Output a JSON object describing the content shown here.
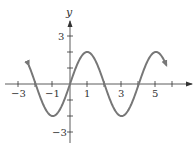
{
  "chart_data": {
    "type": "line",
    "title": "",
    "xlabel": "x",
    "ylabel": "y",
    "function": "y = 2 sin(πx/2)",
    "xlim": [
      -3.5,
      7.2
    ],
    "ylim": [
      -3.7,
      3.8
    ],
    "x_ticks": [
      -3,
      -2,
      -1,
      0,
      1,
      2,
      3,
      4,
      5,
      6
    ],
    "x_tick_labels": [
      "-3",
      "-1",
      "1",
      "3",
      "5"
    ],
    "y_ticks": [
      -3,
      -2,
      -1,
      1,
      2,
      3
    ],
    "y_tick_labels": [
      "3",
      "-3"
    ],
    "grid": false,
    "legend": null,
    "series": [
      {
        "name": "curve",
        "color": "#777777",
        "x": [
          -2.4,
          -2,
          -1,
          0,
          1,
          2,
          3,
          4,
          5,
          5.6
        ],
        "y": [
          0.62,
          0,
          -2,
          0,
          2,
          0,
          -2,
          0,
          2,
          1.18
        ],
        "arrows_at_ends": true
      }
    ]
  },
  "labels": {
    "y_axis": "y",
    "x_ticks": {
      "m3": "−3",
      "m1": "−1",
      "p1": "1",
      "p3": "3",
      "p5": "5"
    },
    "y_ticks": {
      "p3": "3",
      "m3": "−3"
    }
  }
}
